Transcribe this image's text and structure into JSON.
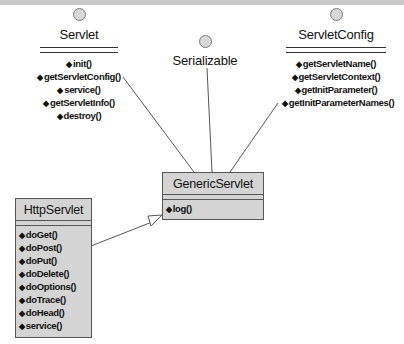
{
  "diagram": {
    "type": "UML class diagram",
    "interfaces": [
      {
        "name": "Servlet",
        "operations": [
          "init()",
          "getServletConfig()",
          "service()",
          "getServletInfo()",
          "destroy()"
        ]
      },
      {
        "name": "Serializable",
        "operations": []
      },
      {
        "name": "ServletConfig",
        "operations": [
          "getServletName()",
          "getServletContext()",
          "getInitParameter()",
          "getInitParameterNames()"
        ]
      }
    ],
    "classes": [
      {
        "name": "GenericServlet",
        "operations": [
          "log()"
        ]
      },
      {
        "name": "HttpServlet",
        "operations": [
          "doGet()",
          "doPost()",
          "doPut()",
          "doDelete()",
          "doOptions()",
          "doTrace()",
          "doHead()",
          "service()"
        ]
      }
    ],
    "relations": [
      {
        "from": "GenericServlet",
        "to": "Servlet",
        "kind": "realization"
      },
      {
        "from": "GenericServlet",
        "to": "Serializable",
        "kind": "realization"
      },
      {
        "from": "GenericServlet",
        "to": "ServletConfig",
        "kind": "realization"
      },
      {
        "from": "HttpServlet",
        "to": "GenericServlet",
        "kind": "generalization"
      }
    ],
    "operation_marker": "◆"
  }
}
